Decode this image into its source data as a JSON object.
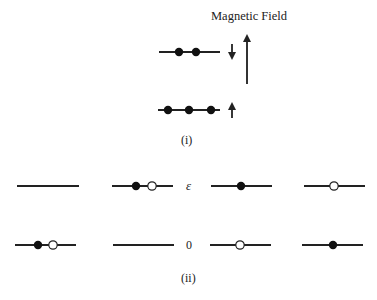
{
  "panel_i": {
    "title": "Magnetic Field",
    "caption": "(i)",
    "levels": [
      {
        "name": "upper-level",
        "y": 52,
        "x1": 159,
        "x2": 220,
        "electrons": [
          179,
          196
        ],
        "spin_arrow": "down"
      },
      {
        "name": "lower-level",
        "y": 110,
        "x1": 158,
        "x2": 220,
        "electrons": [
          168,
          189,
          211
        ],
        "spin_arrow": "up"
      }
    ]
  },
  "panel_ii": {
    "caption": "(ii)",
    "energy_labels": {
      "upper": "ε",
      "lower": "0"
    },
    "upper_row_y": 186,
    "lower_row_y": 245,
    "configs": [
      {
        "upper": {
          "x1": 17,
          "x2": 79,
          "filled": [],
          "open": []
        },
        "lower": {
          "x1": 15,
          "x2": 76,
          "filled": [
            38
          ],
          "open": [
            53
          ]
        }
      },
      {
        "upper": {
          "x1": 112,
          "x2": 173,
          "filled": [
            136
          ],
          "open": [
            152
          ]
        },
        "lower": {
          "x1": 113,
          "x2": 174,
          "filled": [],
          "open": []
        }
      },
      {
        "upper": {
          "x1": 211,
          "x2": 272,
          "filled": [
            241
          ],
          "open": []
        },
        "lower": {
          "x1": 210,
          "x2": 271,
          "filled": [],
          "open": [
            240
          ]
        }
      },
      {
        "upper": {
          "x1": 304,
          "x2": 365,
          "filled": [],
          "open": [
            334
          ]
        },
        "lower": {
          "x1": 302,
          "x2": 363,
          "filled": [
            333
          ],
          "open": []
        }
      }
    ]
  },
  "colors": {
    "line": "#222222",
    "fill": "#111111",
    "open_fill": "#ffffff"
  }
}
